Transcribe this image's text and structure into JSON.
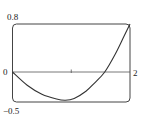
{
  "chart_data": {
    "type": "line",
    "title": "",
    "xlabel": "",
    "ylabel": "",
    "xlim": [
      0,
      2
    ],
    "ylim": [
      -0.5,
      0.8
    ],
    "grid": false,
    "legend": null,
    "x_tick_labels": [
      {
        "value": 0,
        "label": "0"
      },
      {
        "value": 2,
        "label": "2"
      }
    ],
    "x_minor_ticks": [
      1
    ],
    "y_tick_labels": [
      {
        "value": 0.8,
        "label": "0.8"
      },
      {
        "value": -0.5,
        "label": "−0.5"
      }
    ],
    "series": [
      {
        "name": "f(x)",
        "x": [
          0,
          0.25,
          0.5,
          0.75,
          0.9,
          1.05,
          1.25,
          1.4,
          1.57,
          1.75,
          1.9,
          2.0
        ],
        "y": [
          0,
          -0.22,
          -0.37,
          -0.45,
          -0.47,
          -0.44,
          -0.32,
          -0.18,
          0,
          0.3,
          0.6,
          0.8
        ]
      }
    ]
  },
  "labels": {
    "y_top": "0.8",
    "y_bottom": "−0.5",
    "x_left": "0",
    "x_right": "2"
  },
  "colors": {
    "line": "#333333",
    "frame": "#444444",
    "axis": "#555555",
    "background": "#ffffff"
  }
}
